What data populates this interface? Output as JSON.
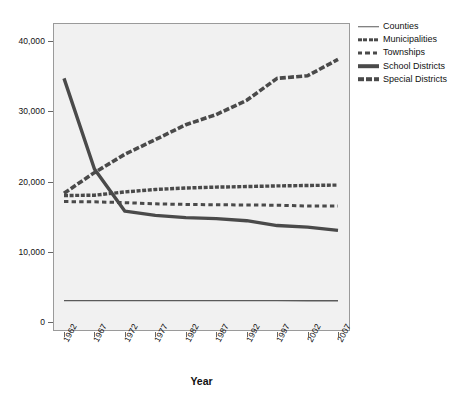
{
  "chart_data": {
    "type": "line",
    "title": "",
    "xlabel": "Year",
    "ylabel": "",
    "x": [
      1962,
      1967,
      1972,
      1977,
      1982,
      1987,
      1992,
      1997,
      2002,
      2007
    ],
    "xtick_labels": [
      "1962",
      "1967",
      "1972",
      "1977",
      "1982",
      "1987",
      "1992",
      "1997",
      "2002",
      "2007"
    ],
    "ytick_labels": [
      "0",
      "10,000",
      "20,000",
      "30,000",
      "40,000"
    ],
    "ytick_values": [
      0,
      10000,
      20000,
      30000,
      40000
    ],
    "ylim": [
      0,
      43000
    ],
    "grid": false,
    "legend_position": "right",
    "series": [
      {
        "name": "Counties",
        "style": "thin-solid",
        "values": [
          3043,
          3049,
          3044,
          3042,
          3041,
          3042,
          3043,
          3043,
          3034,
          3033
        ]
      },
      {
        "name": "Municipalities",
        "style": "thick-dash-dot",
        "values": [
          18000,
          18048,
          18517,
          18862,
          19076,
          19200,
          19279,
          19372,
          19429,
          19492
        ]
      },
      {
        "name": "Townships",
        "style": "dashed",
        "values": [
          17142,
          17105,
          16991,
          16822,
          16734,
          16691,
          16656,
          16629,
          16504,
          16519
        ]
      },
      {
        "name": "School Districts",
        "style": "thick-solid",
        "values": [
          34678,
          21782,
          15781,
          15174,
          14851,
          14721,
          14422,
          13726,
          13506,
          13051
        ]
      },
      {
        "name": "Special Districts",
        "style": "thick-dashed",
        "values": [
          18323,
          21264,
          23885,
          25962,
          28078,
          29532,
          31555,
          34683,
          35052,
          37381
        ]
      }
    ]
  },
  "legend": {
    "items": [
      {
        "label": "Counties"
      },
      {
        "label": "Municipalities"
      },
      {
        "label": "Townships"
      },
      {
        "label": "School Districts"
      },
      {
        "label": "Special Districts"
      }
    ]
  },
  "axis": {
    "x_title": "Year"
  }
}
